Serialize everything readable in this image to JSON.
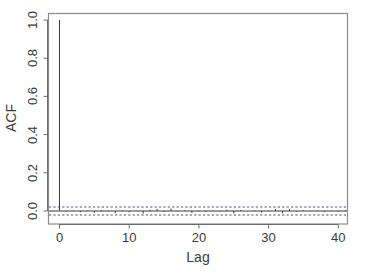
{
  "chart_data": {
    "type": "bar",
    "title": "",
    "subtitle": "",
    "xlabel": "Lag",
    "ylabel": "ACF",
    "xlim": [
      -1.2,
      41.8
    ],
    "ylim": [
      -0.06,
      1.02
    ],
    "grid": false,
    "legend": null,
    "xticks": [
      0,
      10,
      20,
      30,
      40
    ],
    "xtick_labels": [
      "0",
      "10",
      "20",
      "30",
      "40"
    ],
    "yticks": [
      0.0,
      0.2,
      0.4,
      0.6,
      0.8,
      1.0
    ],
    "ytick_labels": [
      "0.0",
      "0.2",
      "0.4",
      "0.6",
      "0.8",
      "1.0"
    ],
    "zero_line": 0.0,
    "confidence_bands": [
      0.021,
      -0.021
    ],
    "confidence_style": "dashed",
    "confidence_color": "#4a4a8c",
    "stem_color": "#3a3a3a",
    "x": [
      0,
      1,
      2,
      3,
      4,
      5,
      6,
      7,
      8,
      9,
      10,
      11,
      12,
      13,
      14,
      15,
      16,
      17,
      18,
      19,
      20,
      21,
      22,
      23,
      24,
      25,
      26,
      27,
      28,
      29,
      30,
      31,
      32,
      33,
      34,
      35,
      36,
      37,
      38,
      39,
      40,
      41
    ],
    "values": [
      1.0,
      -0.004,
      0.003,
      -0.006,
      0.002,
      -0.009,
      0.005,
      -0.003,
      -0.012,
      0.004,
      -0.007,
      0.002,
      -0.014,
      0.006,
      0.011,
      -0.005,
      0.013,
      -0.004,
      0.003,
      -0.01,
      0.002,
      -0.006,
      0.004,
      -0.003,
      0.007,
      -0.013,
      0.005,
      -0.002,
      0.003,
      -0.008,
      0.002,
      0.01,
      -0.012,
      0.009,
      -0.003,
      0.004,
      -0.002,
      0.003,
      -0.005,
      0.002,
      -0.004,
      0.003
    ]
  },
  "axis": {
    "ylabel": "ACF",
    "xlabel": "Lag"
  }
}
